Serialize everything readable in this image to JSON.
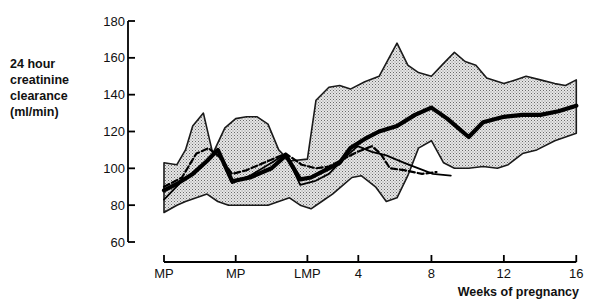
{
  "chart_data": {
    "type": "line",
    "title": "",
    "ylabel": "24 hour creatinine clearance (ml/min)",
    "ylabel_lines": [
      "24 hour",
      "creatinine",
      "clearance",
      "(ml/min)"
    ],
    "xlabel": "Weeks of pregnancy",
    "ylim": [
      60,
      180
    ],
    "yticks": [
      60,
      80,
      100,
      120,
      140,
      160,
      180
    ],
    "xticks": [
      {
        "label": "MP",
        "pos": 0
      },
      {
        "label": "MP",
        "pos": 1
      },
      {
        "label": "LMP",
        "pos": 2
      },
      {
        "label": "4",
        "pos": 2.71
      },
      {
        "label": "8",
        "pos": 3.73
      },
      {
        "label": "12",
        "pos": 4.74
      },
      {
        "label": "16",
        "pos": 5.75
      }
    ],
    "grid": false,
    "legend": null,
    "pixel_mapping": {
      "x_px_at_pos0": 164,
      "x_px_per_pos": 71.7,
      "y_px_at_180": 21,
      "y_px_at_60": 242
    },
    "series": [
      {
        "name": "range upper bound",
        "style": "shaded-band-upper",
        "x": [
          0,
          0.18,
          0.3,
          0.4,
          0.55,
          0.68,
          0.85,
          1.0,
          1.15,
          1.3,
          1.45,
          1.6,
          1.75,
          2.0,
          2.12,
          2.3,
          2.45,
          2.6,
          2.8,
          3.0,
          3.25,
          3.4,
          3.55,
          3.73,
          3.9,
          4.05,
          4.2,
          4.35,
          4.5,
          4.74,
          4.9,
          5.05,
          5.25,
          5.45,
          5.6,
          5.75
        ],
        "values": [
          103,
          102,
          110,
          123,
          130,
          108,
          122,
          127,
          128,
          128,
          124,
          110,
          104,
          105,
          137,
          144,
          145,
          143,
          147,
          150,
          168,
          156,
          152,
          150,
          157,
          163,
          158,
          156,
          149,
          146,
          148,
          150,
          148,
          146,
          145,
          148
        ]
      },
      {
        "name": "range lower bound",
        "style": "shaded-band-lower",
        "x": [
          0,
          0.18,
          0.3,
          0.45,
          0.6,
          0.75,
          0.9,
          1.05,
          1.25,
          1.45,
          1.6,
          1.75,
          1.9,
          2.05,
          2.2,
          2.35,
          2.5,
          2.62,
          2.75,
          2.95,
          3.1,
          3.25,
          3.4,
          3.55,
          3.73,
          3.9,
          4.05,
          4.25,
          4.45,
          4.65,
          4.8,
          5.0,
          5.2,
          5.45,
          5.75
        ],
        "values": [
          76,
          80,
          82,
          84,
          86,
          82,
          80,
          80,
          80,
          80,
          82,
          84,
          80,
          78,
          82,
          86,
          91,
          95,
          96,
          90,
          82,
          84,
          96,
          111,
          115,
          103,
          100,
          100,
          101,
          100,
          102,
          108,
          110,
          115,
          119
        ]
      },
      {
        "name": "mean (thick solid)",
        "style": "thick-solid",
        "x": [
          0,
          0.2,
          0.4,
          0.6,
          0.75,
          0.95,
          1.2,
          1.5,
          1.7,
          1.9,
          2.05,
          2.25,
          2.45,
          2.6,
          2.8,
          3.0,
          3.25,
          3.5,
          3.73,
          3.95,
          4.25,
          4.45,
          4.74,
          5.0,
          5.25,
          5.5,
          5.75
        ],
        "values": [
          88,
          92,
          97,
          104,
          110,
          93,
          95,
          100,
          107,
          94,
          95,
          99,
          103,
          111,
          116,
          120,
          123,
          129,
          133,
          127,
          117,
          125,
          128,
          129,
          129,
          131,
          134
        ]
      },
      {
        "name": "second solid series",
        "style": "medium-solid",
        "x": [
          0,
          0.25,
          0.5,
          0.75,
          0.95,
          1.2,
          1.5,
          1.7,
          1.9,
          2.1,
          2.3,
          2.5,
          2.7,
          2.9,
          3.1,
          3.35,
          3.55,
          3.75,
          4.0
        ],
        "values": [
          83,
          93,
          100,
          110,
          92,
          96,
          103,
          108,
          91,
          93,
          97,
          105,
          112,
          109,
          107,
          103,
          100,
          97,
          96
        ]
      },
      {
        "name": "dashed series",
        "style": "dashed",
        "x": [
          0,
          0.25,
          0.45,
          0.62,
          0.78,
          0.95,
          1.15,
          1.45,
          1.7,
          1.92,
          2.12,
          2.3,
          2.5,
          2.7,
          2.9,
          3.02,
          3.15,
          3.35,
          3.6,
          3.8
        ],
        "values": [
          90,
          95,
          108,
          111,
          106,
          97,
          99,
          104,
          108,
          102,
          100,
          101,
          105,
          109,
          112,
          108,
          100,
          99,
          97,
          98
        ]
      }
    ]
  }
}
